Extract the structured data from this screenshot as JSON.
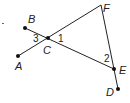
{
  "diagram": {
    "type": "geometry",
    "colors": {
      "line": "#222222",
      "point": "#111111",
      "background": "#ffffff"
    },
    "points": [
      {
        "id": "A",
        "label": "A",
        "x": 18,
        "y": 56,
        "label_x": 15,
        "label_y": 70
      },
      {
        "id": "B",
        "label": "B",
        "x": 25,
        "y": 28,
        "label_x": 28,
        "label_y": 23
      },
      {
        "id": "C",
        "label": "C",
        "x": 48,
        "y": 38,
        "label_x": 43,
        "label_y": 54
      },
      {
        "id": "D",
        "label": "D",
        "x": 118,
        "y": 89,
        "label_x": 106,
        "label_y": 96
      },
      {
        "id": "E",
        "label": "E",
        "x": 114,
        "y": 69,
        "label_x": 119,
        "label_y": 74
      },
      {
        "id": "F",
        "label": "F",
        "x": 101,
        "y": 5,
        "label_x": 103,
        "label_y": 12
      }
    ],
    "segments": [
      {
        "from": "A",
        "to": "F"
      },
      {
        "from": "B",
        "to": "E"
      },
      {
        "from": "F",
        "to": "D"
      }
    ],
    "angle_labels": [
      {
        "label": "1",
        "x": 58,
        "y": 42
      },
      {
        "label": "2",
        "x": 104,
        "y": 62
      },
      {
        "label": "3",
        "x": 33,
        "y": 42
      }
    ],
    "stray_mark": {
      "x": 3,
      "y": 24
    }
  }
}
